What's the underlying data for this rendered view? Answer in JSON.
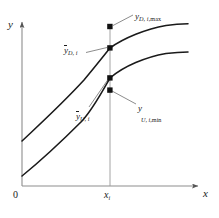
{
  "figure": {
    "type": "line-diagram",
    "background_color": "#ffffff",
    "ink_color": "#1a1a1a",
    "guide_color": "#9a9a9a",
    "axes": {
      "x_label": "x",
      "y_label": "y",
      "origin_label": "0",
      "x_tick_label": "x",
      "x_tick_subscript": "i",
      "grid": false
    },
    "curves": [
      {
        "id": "upper-curve",
        "name": "D-curve",
        "description": "upper concave increasing curve",
        "points": [
          [
            22,
            141
          ],
          [
            34,
            128
          ],
          [
            48,
            114
          ],
          [
            62,
            100
          ],
          [
            76,
            85
          ],
          [
            90,
            69
          ],
          [
            104,
            54
          ],
          [
            110,
            48
          ],
          [
            124,
            40
          ],
          [
            140,
            33
          ],
          [
            158,
            28
          ],
          [
            174,
            25
          ],
          [
            188,
            24
          ]
        ]
      },
      {
        "id": "lower-curve",
        "name": "U-curve",
        "description": "lower concave increasing curve",
        "points": [
          [
            22,
            176
          ],
          [
            34,
            166
          ],
          [
            48,
            154
          ],
          [
            62,
            141
          ],
          [
            76,
            127
          ],
          [
            90,
            111
          ],
          [
            104,
            88
          ],
          [
            110,
            78
          ],
          [
            124,
            68
          ],
          [
            140,
            61
          ],
          [
            158,
            56
          ],
          [
            174,
            53
          ],
          [
            188,
            52
          ]
        ]
      }
    ],
    "vertical_guide": {
      "x": 110,
      "y_top": 27,
      "y_bottom": 186
    },
    "markers": [
      {
        "id": "y-D-max",
        "x": 110,
        "y": 27,
        "label_key": "y_D_i_max"
      },
      {
        "id": "y-D-bar",
        "x": 110,
        "y": 48,
        "label_key": "y_D_i_bar"
      },
      {
        "id": "y-U-bar",
        "x": 110,
        "y": 78,
        "label_key": "y_U_i_bar"
      },
      {
        "id": "y-U-min",
        "x": 110,
        "y": 90,
        "label_key": "y_U_i_min"
      }
    ],
    "labels": {
      "y_D_i_max": {
        "base": "y",
        "sub": "D, i,",
        "rom": "max",
        "bar": false,
        "x": 135,
        "y": 12
      },
      "y_D_i_bar": {
        "base": "y",
        "sub": "D, i",
        "rom": "",
        "bar": true,
        "x": 64,
        "y": 46
      },
      "y_U_i_bar": {
        "base": "y",
        "sub": "U, i",
        "rom": "",
        "bar": true,
        "x": 76,
        "y": 112
      },
      "y_U_i_min": {
        "base": "y",
        "sub": "U, i,",
        "rom": "min",
        "bar": false,
        "x": 138,
        "y": 109
      }
    },
    "leaders": [
      {
        "id": "leader-y-D-max",
        "from": [
          113,
          26
        ],
        "to": [
          133,
          15
        ]
      },
      {
        "id": "leader-y-D-bar",
        "from": [
          107,
          48
        ],
        "to": [
          86,
          52
        ]
      },
      {
        "id": "leader-y-U-bar",
        "from": [
          108,
          79
        ],
        "to": [
          89,
          108
        ]
      },
      {
        "id": "leader-y-U-min",
        "from": [
          112,
          91
        ],
        "to": [
          136,
          105
        ]
      }
    ],
    "caption": ""
  }
}
